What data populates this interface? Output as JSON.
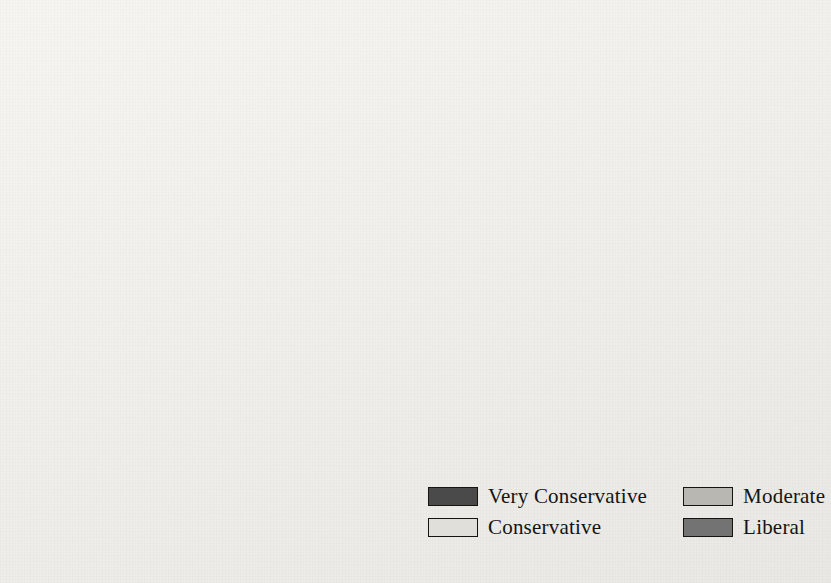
{
  "map": {
    "title": "United States political ideology by state",
    "background_color": "#f2f1ee",
    "border_color": "#15140f",
    "internal_border_color": "#fbfbfa"
  },
  "legend": {
    "items": [
      {
        "label": "Very Conservative",
        "color": "#4a4a4a"
      },
      {
        "label": "Conservative",
        "color": "#e0dfda"
      },
      {
        "label": "Moderate",
        "color": "#b8b7b2"
      },
      {
        "label": "Liberal",
        "color": "#737373"
      }
    ]
  },
  "colors": {
    "very_conservative": "#4a4a4a",
    "conservative": "#e0dfda",
    "moderate": "#b8b7b2",
    "liberal": "#737373",
    "lake": "#cfcdc8"
  },
  "states": [
    {
      "code": "WA",
      "name": "Washington",
      "category": "Moderate",
      "color": "#b8b7b2",
      "label_x": 126,
      "label_y": 78,
      "callout": false
    },
    {
      "code": "OR",
      "name": "Oregon",
      "category": "Moderate",
      "color": "#b8b7b2",
      "label_x": 113,
      "label_y": 128,
      "callout": false
    },
    {
      "code": "CA",
      "name": "California",
      "category": "Liberal",
      "color": "#737373",
      "label_x": 99,
      "label_y": 253,
      "callout": false
    },
    {
      "code": "NV",
      "name": "Nevada",
      "category": "Conservative",
      "color": "#e0dfda",
      "label_x": 146,
      "label_y": 211,
      "callout": false
    },
    {
      "code": "ID",
      "name": "Idaho",
      "category": "Very Conservative",
      "color": "#4a4a4a",
      "label_x": 188,
      "label_y": 142,
      "callout": false
    },
    {
      "code": "MT",
      "name": "Montana",
      "category": "Conservative",
      "color": "#e0dfda",
      "label_x": 261,
      "label_y": 100,
      "callout": false
    },
    {
      "code": "WY",
      "name": "Wyoming",
      "category": "Conservative",
      "color": "#e0dfda",
      "label_x": 274,
      "label_y": 166,
      "callout": false
    },
    {
      "code": "UT",
      "name": "Utah",
      "category": "Very Conservative",
      "color": "#4a4a4a",
      "label_x": 214,
      "label_y": 231,
      "callout": false
    },
    {
      "code": "AZ",
      "name": "Arizona",
      "category": "Very Conservative",
      "color": "#4a4a4a",
      "label_x": 198,
      "label_y": 311,
      "callout": false
    },
    {
      "code": "NM",
      "name": "New Mexico",
      "category": "Conservative",
      "color": "#e0dfda",
      "label_x": 277,
      "label_y": 323,
      "callout": false
    },
    {
      "code": "CO",
      "name": "Colorado",
      "category": "Conservative",
      "color": "#e0dfda",
      "label_x": 290,
      "label_y": 242,
      "callout": false
    },
    {
      "code": "ND",
      "name": "North Dakota",
      "category": "Very Conservative",
      "color": "#4a4a4a",
      "label_x": 375,
      "label_y": 98,
      "callout": false
    },
    {
      "code": "SD",
      "name": "South Dakota",
      "category": "Conservative",
      "color": "#e0dfda",
      "label_x": 369,
      "label_y": 152,
      "callout": false
    },
    {
      "code": "NE",
      "name": "Nebraska",
      "category": "Conservative",
      "color": "#e0dfda",
      "label_x": 368,
      "label_y": 197,
      "callout": false
    },
    {
      "code": "KS",
      "name": "Kansas",
      "category": "Conservative",
      "color": "#e0dfda",
      "label_x": 391,
      "label_y": 252,
      "callout": false
    },
    {
      "code": "OK",
      "name": "Oklahoma",
      "category": "Very Conservative",
      "color": "#4a4a4a",
      "label_x": 412,
      "label_y": 307,
      "callout": false
    },
    {
      "code": "TX",
      "name": "Texas",
      "category": "Very Conservative",
      "color": "#4a4a4a",
      "label_x": 388,
      "label_y": 377,
      "callout": false
    },
    {
      "code": "MN",
      "name": "Minnesota",
      "category": "Moderate",
      "color": "#b8b7b2",
      "label_x": 441,
      "label_y": 124,
      "callout": false
    },
    {
      "code": "IA",
      "name": "Iowa",
      "category": "Moderate",
      "color": "#b8b7b2",
      "label_x": 459,
      "label_y": 192,
      "callout": false
    },
    {
      "code": "MO",
      "name": "Missouri",
      "category": "Moderate",
      "color": "#b8b7b2",
      "label_x": 470,
      "label_y": 253,
      "callout": false
    },
    {
      "code": "AR",
      "name": "Arkansas",
      "category": "Conservative",
      "color": "#e0dfda",
      "label_x": 473,
      "label_y": 320,
      "callout": false
    },
    {
      "code": "LA",
      "name": "Louisiana",
      "category": "Conservative",
      "color": "#e0dfda",
      "label_x": 482,
      "label_y": 368,
      "callout": false
    },
    {
      "code": "WI",
      "name": "Wisconsin",
      "category": "Moderate",
      "color": "#b8b7b2",
      "label_x": 504,
      "label_y": 148,
      "callout": false
    },
    {
      "code": "IL",
      "name": "Illinois",
      "category": "Moderate",
      "color": "#b8b7b2",
      "label_x": 519,
      "label_y": 222,
      "callout": false
    },
    {
      "code": "MI",
      "name": "Michigan",
      "category": "Liberal",
      "color": "#737373",
      "label_x": 573,
      "label_y": 169,
      "callout": false
    },
    {
      "code": "IN",
      "name": "Indiana",
      "category": "Very Conservative",
      "color": "#4a4a4a",
      "label_x": 560,
      "label_y": 222,
      "callout": false
    },
    {
      "code": "OH",
      "name": "Ohio",
      "category": "Conservative",
      "color": "#e0dfda",
      "label_x": 600,
      "label_y": 210,
      "callout": false
    },
    {
      "code": "KY",
      "name": "Kentucky",
      "category": "Conservative",
      "color": "#e0dfda",
      "label_x": 570,
      "label_y": 262,
      "callout": false
    },
    {
      "code": "TN",
      "name": "Tennessee",
      "category": "Conservative",
      "color": "#e0dfda",
      "label_x": 561,
      "label_y": 295,
      "callout": false
    },
    {
      "code": "MS",
      "name": "Mississippi",
      "category": "Very Conservative",
      "color": "#4a4a4a",
      "label_x": 521,
      "label_y": 350,
      "callout": false
    },
    {
      "code": "AL",
      "name": "Alabama",
      "category": "Conservative",
      "color": "#e0dfda",
      "label_x": 566,
      "label_y": 346,
      "callout": false
    },
    {
      "code": "GA",
      "name": "Georgia",
      "category": "Moderate",
      "color": "#b8b7b2",
      "label_x": 616,
      "label_y": 344,
      "callout": false
    },
    {
      "code": "FL",
      "name": "Florida",
      "category": "Conservative",
      "color": "#e0dfda",
      "label_x": 662,
      "label_y": 423,
      "callout": false
    },
    {
      "code": "SC",
      "name": "South Carolina",
      "category": "Very Conservative",
      "color": "#4a4a4a",
      "label_x": 645,
      "label_y": 315,
      "callout": false
    },
    {
      "code": "NC",
      "name": "North Carolina",
      "category": "Conservative",
      "color": "#e0dfda",
      "label_x": 672,
      "label_y": 287,
      "callout": false
    },
    {
      "code": "VA",
      "name": "Virginia",
      "category": "Conservative",
      "color": "#e0dfda",
      "label_x": 673,
      "label_y": 246,
      "callout": false
    },
    {
      "code": "WV",
      "name": "West Virginia",
      "category": "Very Conservative",
      "color": "#4a4a4a",
      "label_x": 635,
      "label_y": 240,
      "callout": false
    },
    {
      "code": "PA",
      "name": "Pennsylvania",
      "category": "Conservative",
      "color": "#e0dfda",
      "label_x": 673,
      "label_y": 189,
      "callout": false
    },
    {
      "code": "NY",
      "name": "New York",
      "category": "Liberal",
      "color": "#737373",
      "label_x": 700,
      "label_y": 142,
      "callout": false
    },
    {
      "code": "ME",
      "name": "Maine",
      "category": "Moderate",
      "color": "#b8b7b2",
      "label_x": 756,
      "label_y": 88,
      "callout": false
    },
    {
      "code": "AK",
      "name": "Alaska",
      "category": "Moderate",
      "color": "#b8b7b2",
      "label_x": 110,
      "label_y": 527,
      "callout": false
    },
    {
      "code": "HI",
      "name": "Hawaii",
      "category": "Liberal",
      "color": "#737373",
      "label_x": 233,
      "label_y": 500,
      "callout": false
    },
    {
      "code": "VT",
      "name": "Vermont",
      "category": "Liberal",
      "color": "#737373",
      "label_x": 672,
      "label_y": 74,
      "callout": true,
      "leader": "M 697 82 L 715 118"
    },
    {
      "code": "NH",
      "name": "New Hampshire",
      "category": "Moderate",
      "color": "#b8b7b2",
      "label_x": 702,
      "label_y": 47,
      "callout": true,
      "leader": "M 722 56 L 733 117"
    },
    {
      "code": "MA",
      "name": "Massachusetts",
      "category": "Liberal",
      "color": "#737373",
      "label_x": 769,
      "label_y": 127,
      "callout": true,
      "leader": "M 766 133 L 745 147"
    },
    {
      "code": "RI",
      "name": "Rhode Island",
      "category": "Liberal",
      "color": "#737373",
      "label_x": 776,
      "label_y": 157,
      "callout": true,
      "leader": "M 772 159 L 748 155"
    },
    {
      "code": "CT",
      "name": "Connecticut",
      "category": "Liberal",
      "color": "#737373",
      "label_x": 783,
      "label_y": 182,
      "callout": true,
      "leader": "M 779 181 L 737 163"
    },
    {
      "code": "NJ",
      "name": "New Jersey",
      "category": "Liberal",
      "color": "#737373",
      "label_x": 742,
      "label_y": 186,
      "callout": true,
      "leader": "M 738 187 L 715 180"
    },
    {
      "code": "DE",
      "name": "Delaware",
      "category": "Liberal",
      "color": "#737373",
      "label_x": 737,
      "label_y": 214,
      "callout": true,
      "leader": "M 733 215 L 713 208"
    },
    {
      "code": "MD",
      "name": "Maryland",
      "category": "Liberal",
      "color": "#737373",
      "label_x": 741,
      "label_y": 238,
      "callout": true,
      "leader": "M 737 238 L 708 223"
    }
  ]
}
